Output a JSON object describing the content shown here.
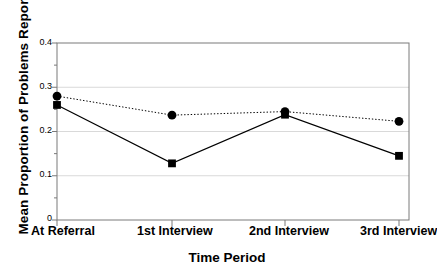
{
  "chart_data": {
    "type": "line",
    "title": "",
    "xlabel": "Time Period",
    "ylabel": "Mean Proportion of Problems Reported",
    "categories": [
      "At Referral",
      "1st Interview",
      "2nd Interview",
      "3rd Interview"
    ],
    "ylim": [
      0,
      0.4
    ],
    "yticks": [
      "0",
      "0.1",
      "0.2",
      "0.3",
      "0.4"
    ],
    "ytick_values": [
      0,
      0.1,
      0.2,
      0.3,
      0.4
    ],
    "grid": "horizontal-light-gray",
    "legend": "none",
    "series": [
      {
        "name": "dotted-circle-series",
        "marker": "circle",
        "line_style": "dotted",
        "color": "#000000",
        "values": [
          0.28,
          0.237,
          0.245,
          0.223
        ]
      },
      {
        "name": "solid-square-series",
        "marker": "square",
        "line_style": "solid",
        "color": "#000000",
        "values": [
          0.26,
          0.128,
          0.238,
          0.145
        ]
      }
    ]
  },
  "axis": {
    "y_tick_labels": [
      "0.4",
      "0.3",
      "0.2",
      "0.1",
      "0"
    ],
    "x_tick_labels": [
      "At Referral",
      "1st Interview",
      "2nd Interview",
      "3rd Interview"
    ],
    "y_title": "Mean Proportion of Problems Reported",
    "x_title": "Time Period"
  },
  "colors": {
    "background": "#ffffff",
    "axis": "#7a7a7a",
    "grid": "#d9d9d9",
    "ink": "#000000"
  }
}
